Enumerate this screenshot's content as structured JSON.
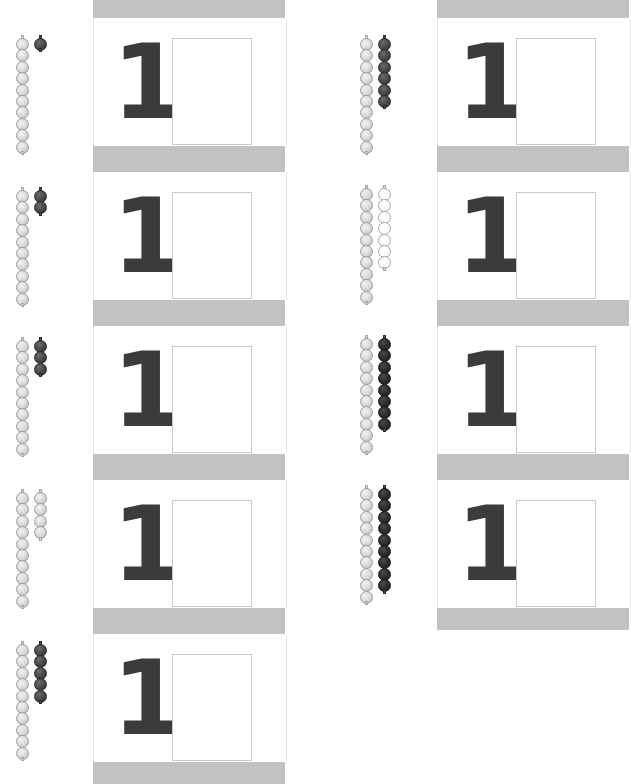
{
  "worksheet": {
    "title": "Number one tracing and bead-chain counting worksheet",
    "page_width": 630,
    "page_height": 784,
    "digit_glyph": "1",
    "colors": {
      "band_gray": "#c2c2c2",
      "bead_light": "#dcdcdc",
      "bead_dark": "#3a3a3a",
      "bead_white": "#ffffff",
      "digit": "#3b3b3b",
      "box_border": "#c9c9c9",
      "tick": "#4a4a4a",
      "page_background": "#ffffff"
    }
  },
  "bead_groups": [
    {
      "id": "bead-group-1",
      "x": 4,
      "y": 38,
      "left_count": 10,
      "left_shade": "light",
      "right_count": 1,
      "right_shade": "dark"
    },
    {
      "id": "bead-group-2",
      "x": 4,
      "y": 190,
      "left_count": 10,
      "left_shade": "light",
      "right_count": 2,
      "right_shade": "dark"
    },
    {
      "id": "bead-group-3",
      "x": 4,
      "y": 340,
      "left_count": 10,
      "left_shade": "light",
      "right_count": 3,
      "right_shade": "dark"
    },
    {
      "id": "bead-group-4",
      "x": 4,
      "y": 492,
      "left_count": 10,
      "left_shade": "light",
      "right_count": 4,
      "right_shade": "light"
    },
    {
      "id": "bead-group-5",
      "x": 4,
      "y": 644,
      "left_count": 10,
      "left_shade": "light",
      "right_count": 5,
      "right_shade": "dark"
    },
    {
      "id": "bead-group-6",
      "x": 348,
      "y": 38,
      "left_count": 10,
      "left_shade": "light",
      "right_count": 6,
      "right_shade": "dark"
    },
    {
      "id": "bead-group-7",
      "x": 348,
      "y": 188,
      "left_count": 10,
      "left_shade": "light",
      "right_count": 7,
      "right_shade": "white"
    },
    {
      "id": "bead-group-8",
      "x": 348,
      "y": 338,
      "left_count": 10,
      "left_shade": "light",
      "right_count": 8,
      "right_shade": "darker"
    },
    {
      "id": "bead-group-9",
      "x": 348,
      "y": 488,
      "left_count": 10,
      "left_shade": "light",
      "right_count": 9,
      "right_shade": "darker"
    }
  ],
  "card_columns": [
    {
      "id": "card-column-left",
      "x": 93,
      "y": 18,
      "width": 192,
      "tick_x": 132,
      "tick_y": 0,
      "cards": [
        {
          "id": "card-l1",
          "y": 18,
          "height": 128,
          "digit": "1",
          "box": {
            "x": 78,
            "y": 20,
            "w": 78,
            "h": 105
          }
        },
        {
          "id": "card-l2",
          "y": 172,
          "height": 128,
          "digit": "1",
          "box": {
            "x": 78,
            "y": 20,
            "w": 78,
            "h": 105
          }
        },
        {
          "id": "card-l3",
          "y": 326,
          "height": 128,
          "digit": "1",
          "box": {
            "x": 78,
            "y": 20,
            "w": 78,
            "h": 105
          }
        },
        {
          "id": "card-l4",
          "y": 480,
          "height": 128,
          "digit": "1",
          "box": {
            "x": 78,
            "y": 20,
            "w": 78,
            "h": 105
          }
        },
        {
          "id": "card-l5",
          "y": 634,
          "height": 128,
          "digit": "1",
          "box": {
            "x": 78,
            "y": 20,
            "w": 78,
            "h": 105
          }
        }
      ],
      "bands": [
        {
          "y": 0,
          "height": 18
        },
        {
          "y": 146,
          "height": 26
        },
        {
          "y": 300,
          "height": 26
        },
        {
          "y": 454,
          "height": 26
        },
        {
          "y": 608,
          "height": 26
        },
        {
          "y": 762,
          "height": 22
        }
      ]
    },
    {
      "id": "card-column-right",
      "x": 437,
      "y": 18,
      "width": 192,
      "tick_x": 494,
      "tick_y": 0,
      "cards": [
        {
          "id": "card-r1",
          "y": 18,
          "height": 128,
          "digit": "1",
          "box": {
            "x": 78,
            "y": 20,
            "w": 78,
            "h": 105
          }
        },
        {
          "id": "card-r2",
          "y": 172,
          "height": 128,
          "digit": "1",
          "box": {
            "x": 78,
            "y": 20,
            "w": 78,
            "h": 105
          }
        },
        {
          "id": "card-r3",
          "y": 326,
          "height": 128,
          "digit": "1",
          "box": {
            "x": 78,
            "y": 20,
            "w": 78,
            "h": 105
          }
        },
        {
          "id": "card-r4",
          "y": 480,
          "height": 128,
          "digit": "1",
          "box": {
            "x": 78,
            "y": 20,
            "w": 78,
            "h": 105
          }
        }
      ],
      "bands": [
        {
          "y": 0,
          "height": 18
        },
        {
          "y": 146,
          "height": 26
        },
        {
          "y": 300,
          "height": 26
        },
        {
          "y": 454,
          "height": 26
        },
        {
          "y": 608,
          "height": 22
        }
      ]
    }
  ]
}
